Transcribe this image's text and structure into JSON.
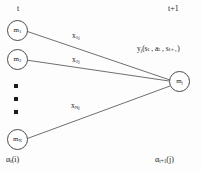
{
  "figure": {
    "type": "trellis-transition-diagram",
    "background_color": "#fdfdfd",
    "stroke_color": "#4a4a4a",
    "text_color": "#1a1a1a"
  },
  "time_axis": {
    "left_label": "t",
    "right_label": "t+1"
  },
  "left_nodes": [
    {
      "label_main": "m",
      "label_sub": "1"
    },
    {
      "label_main": "m",
      "label_sub": "2"
    },
    {
      "label_main": "m",
      "label_sub": "N"
    }
  ],
  "right_node": {
    "label_main": "m",
    "label_sub": "j"
  },
  "vertical_ellipsis": {
    "dot_count": 3
  },
  "edges": [
    {
      "from": "m1",
      "to": "mj",
      "label_main": "x",
      "label_sub": "1j"
    },
    {
      "from": "m2",
      "to": "mj",
      "label_main": "x",
      "label_sub": "2j"
    },
    {
      "from": "mN",
      "to": "mj",
      "label_main": "x",
      "label_sub": "Nj"
    }
  ],
  "output_label": {
    "main": "y",
    "sub": "j",
    "args": "(sₜ , aₜ , sₜ₊₁)"
  },
  "alpha_labels": {
    "left": {
      "main": "α",
      "sub": "t",
      "args": "(i)"
    },
    "right": {
      "main": "α",
      "sub": "t+1",
      "args": "(j)"
    }
  }
}
